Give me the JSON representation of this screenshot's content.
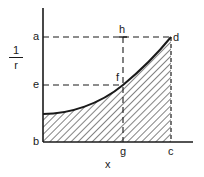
{
  "diagram": {
    "y_axis_label": {
      "numerator": "1",
      "denominator": "r"
    },
    "x_axis_label": "x",
    "points": {
      "a": "a",
      "b": "b",
      "c": "c",
      "d": "d",
      "e": "e",
      "f": "f",
      "g": "g",
      "h": "h"
    },
    "region": "area under curve from b to c, hatched",
    "colors": {
      "line": "#1a1a1a",
      "background": "#ffffff"
    }
  }
}
